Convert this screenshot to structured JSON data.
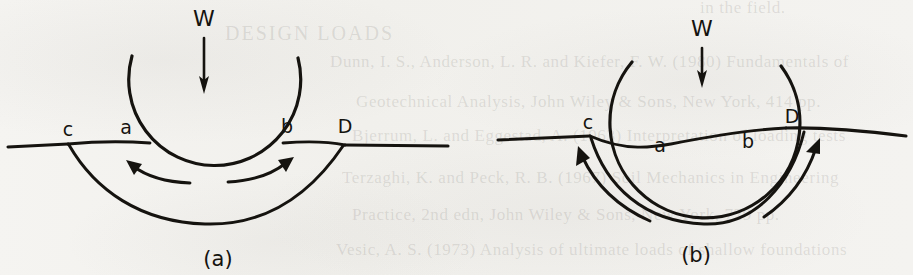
{
  "page": {
    "width": 913,
    "height": 275,
    "background_color": "#f3f2ef",
    "ink_color": "#15130f"
  },
  "figures": [
    {
      "id": "figure-a",
      "caption": "(a)",
      "load_label": "W",
      "description": "Deep circular slip surface beneath a loaded footing with two curved flow arrows pointing up and outward",
      "point_labels": [
        {
          "name": "c",
          "text": "c"
        },
        {
          "name": "a",
          "text": "a"
        },
        {
          "name": "b",
          "text": "b"
        },
        {
          "name": "D",
          "text": "D"
        }
      ],
      "arrows": [
        {
          "name": "flow-arrow-left",
          "direction": "up-left"
        },
        {
          "name": "flow-arrow-right",
          "direction": "up-right"
        },
        {
          "name": "load-arrow",
          "direction": "down"
        }
      ]
    },
    {
      "id": "figure-b",
      "caption": "(b)",
      "load_label": "W",
      "description": "Shallow wide circular slip surface beneath a loaded footing with two long curved flow arrows pointing up and outward",
      "point_labels": [
        {
          "name": "c",
          "text": "c"
        },
        {
          "name": "a",
          "text": "a"
        },
        {
          "name": "b",
          "text": "b"
        },
        {
          "name": "D",
          "text": "D"
        }
      ],
      "arrows": [
        {
          "name": "flow-arrow-left",
          "direction": "up-left"
        },
        {
          "name": "flow-arrow-right",
          "direction": "up-right"
        },
        {
          "name": "load-arrow",
          "direction": "down"
        }
      ]
    }
  ],
  "background_text": {
    "description": "Faint show-through text from the reverse side of the scanned page",
    "lines": [
      {
        "name": "ghost-line-1",
        "text": "in the field."
      },
      {
        "name": "ghost-line-2",
        "text": "DESIGN LOADS"
      },
      {
        "name": "ghost-line-3",
        "text": "Dunn, I. S., Anderson, L. R. and Kiefer, F. W. (1980) Fundamentals of"
      },
      {
        "name": "ghost-line-4",
        "text": "Geotechnical Analysis, John Wiley & Sons, New York, 414 pp."
      },
      {
        "name": "ghost-line-5",
        "text": "Bjerrum, L. and Eggestad, A. (1963) Interpretation of loading tests"
      },
      {
        "name": "ghost-line-6",
        "text": "Terzaghi, K. and Peck, R. B. (1967) Soil Mechanics in Engineering"
      },
      {
        "name": "ghost-line-7",
        "text": "Practice, 2nd edn, John Wiley & Sons, New York, 729 pp."
      },
      {
        "name": "ghost-line-8",
        "text": "Vesic, A. S. (1973) Analysis of ultimate loads of shallow foundations"
      }
    ]
  }
}
